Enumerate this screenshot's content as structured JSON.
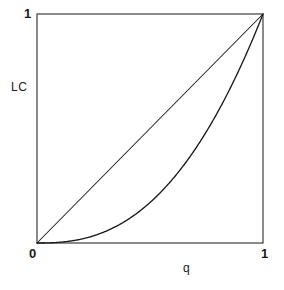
{
  "chart_data": {
    "type": "line",
    "title": "",
    "xlabel": "q",
    "ylabel": "LC",
    "xlim": [
      0,
      1
    ],
    "ylim": [
      0,
      1
    ],
    "xticks": [
      "0",
      "1"
    ],
    "yticks": [
      "1"
    ],
    "grid": false,
    "legend": "none",
    "series": [
      {
        "name": "line-of-equality",
        "kind": "diagonal",
        "x": [
          0,
          1
        ],
        "values": [
          0,
          1
        ]
      },
      {
        "name": "lorenz-curve",
        "kind": "power",
        "exponent": 2.5,
        "x": [
          0,
          0.1,
          0.2,
          0.3,
          0.4,
          0.5,
          0.6,
          0.7,
          0.8,
          0.9,
          1
        ],
        "values": [
          0,
          0.003,
          0.018,
          0.049,
          0.101,
          0.177,
          0.279,
          0.41,
          0.572,
          0.768,
          1
        ]
      }
    ]
  },
  "plot": {
    "axis_color": "#2b2b2b",
    "curve_color": "#1a1a1a",
    "background": "#ffffff",
    "box": {
      "left": 37,
      "top": 14,
      "right": 263,
      "bottom": 243
    }
  },
  "labels": {
    "y_max": "1",
    "y_axis_title": "LC",
    "x_min": "0",
    "x_max": "1",
    "x_axis_title": "q"
  }
}
